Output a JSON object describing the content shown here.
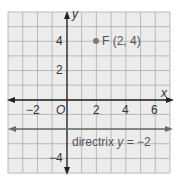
{
  "chart_data": {
    "type": "scatter",
    "title": "",
    "xlabel": "x",
    "ylabel": "y",
    "xlim": [
      -4,
      7
    ],
    "ylim": [
      -5,
      6
    ],
    "grid": true,
    "x_ticks": [
      "-2",
      "2",
      "4",
      "6"
    ],
    "y_ticks": [
      "4",
      "2",
      "-4"
    ],
    "origin_label": "O",
    "points": [
      {
        "name": "F",
        "x": 2,
        "y": 4,
        "label": "F (2, 4)"
      }
    ],
    "lines": [
      {
        "name": "directrix",
        "equation": "y = -2",
        "y": -2,
        "label": "directrix y = −2"
      }
    ],
    "colors": {
      "background": "#ececec",
      "grid": "#b9b9b9",
      "axes": "#222222",
      "directrix": "#6b6b6b",
      "point": "#7a7a7a"
    }
  },
  "labels": {
    "x_axis": "x",
    "y_axis": "y",
    "origin": "O",
    "tick_x_neg2": "−2",
    "tick_x_2": "2",
    "tick_x_4": "4",
    "tick_x_6": "6",
    "tick_y_4": "4",
    "tick_y_2": "2",
    "tick_y_neg4": "−4",
    "focus_label": "F (2, 4)",
    "directrix_word": "directrix ",
    "directrix_var": "y",
    "directrix_eq": " = −2"
  }
}
